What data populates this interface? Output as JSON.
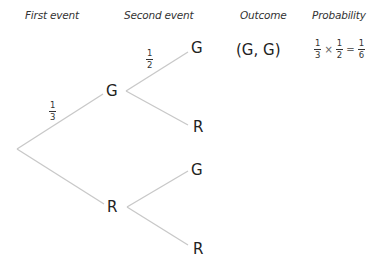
{
  "headers": {
    "first_event": "First event",
    "second_event": "Second event",
    "outcome": "Outcome",
    "probability": "Probability"
  },
  "tree": {
    "level1": [
      {
        "label": "G",
        "probability": {
          "num": "1",
          "den": "3"
        }
      },
      {
        "label": "R",
        "probability": null
      }
    ],
    "level2": [
      {
        "parent": "G",
        "label": "G",
        "probability": {
          "num": "1",
          "den": "2"
        }
      },
      {
        "parent": "G",
        "label": "R",
        "probability": null
      },
      {
        "parent": "R",
        "label": "G",
        "probability": null
      },
      {
        "parent": "R",
        "label": "R",
        "probability": null
      }
    ]
  },
  "outcomes": [
    {
      "outcome": "(G, G)",
      "probability": {
        "a": {
          "num": "1",
          "den": "3"
        },
        "op1": "×",
        "b": {
          "num": "1",
          "den": "2"
        },
        "op2": "=",
        "result": {
          "num": "1",
          "den": "6"
        }
      }
    }
  ],
  "colors": {
    "branch_line": "#c8c8c8",
    "text": "#222222"
  }
}
